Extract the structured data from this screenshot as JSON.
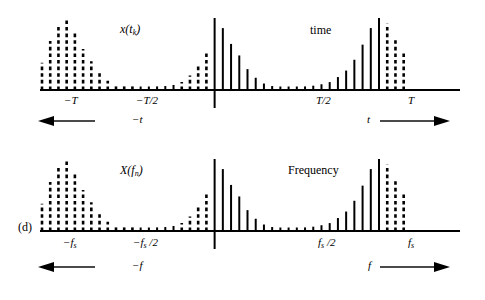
{
  "figure": {
    "panel_label": "(d)",
    "width": 485,
    "height": 300,
    "line_color": "#000000",
    "background": "#ffffff"
  },
  "top_plot": {
    "name": "time-domain-sampled-signal",
    "signal_label": "x(t",
    "signal_label_sub": "k",
    "signal_label_close": ")",
    "domain_label": "time",
    "tick_labels": [
      {
        "text": "−T",
        "x_px": 73
      },
      {
        "text": "−T/2",
        "x_px": 150
      },
      {
        "text": "T/2",
        "x_px": 325
      },
      {
        "text": "T",
        "x_px": 411
      }
    ],
    "left_arrow_label": "−t",
    "right_arrow_label": "t"
  },
  "bottom_plot": {
    "name": "frequency-domain-sampled-spectrum",
    "signal_label": "X(f",
    "signal_label_sub": "n",
    "signal_label_close": ")",
    "domain_label": "Frequency",
    "tick_labels": [
      {
        "text": "−f",
        "sub": "s",
        "tail": "",
        "x_px": 72
      },
      {
        "text": "−f",
        "sub": "s",
        "tail": " /2",
        "x_px": 147
      },
      {
        "text": "f",
        "sub": "s",
        "tail": " /2",
        "x_px": 325
      },
      {
        "text": "f",
        "sub": "s",
        "tail": "",
        "x_px": 412
      }
    ],
    "left_arrow_label": "−f",
    "right_arrow_label": "f"
  },
  "chart_data": [
    {
      "type": "bar",
      "title": "x(t_k)",
      "xlabel": "time",
      "ylabel": "",
      "axis_y_px": 90,
      "x_start_px": 42,
      "x_step_px": 8.22,
      "baseline_px": 90,
      "max_height_px": 72,
      "center_index": 21,
      "center_below_axis_px": 18,
      "tick_positions": {
        "minus_T": 4,
        "minus_T_half": 13,
        "T_half": 34,
        "T": 43
      },
      "xlim_px": [
        40,
        460
      ],
      "grid": false,
      "legend": null,
      "series": [
        {
          "name": "sampled-signal",
          "values": [
            0.38,
            0.68,
            0.88,
            1.0,
            0.82,
            0.57,
            0.4,
            0.26,
            0.13,
            0.09,
            0.06,
            0.05,
            0.04,
            0.045,
            0.05,
            0.055,
            0.07,
            0.11,
            0.2,
            0.33,
            0.52,
            1.0,
            0.86,
            0.64,
            0.48,
            0.29,
            0.17,
            0.09,
            0.055,
            0.045,
            0.04,
            0.045,
            0.05,
            0.06,
            0.08,
            0.11,
            0.18,
            0.27,
            0.42,
            0.63,
            0.86,
            1.0,
            0.92,
            0.73,
            0.52
          ],
          "styles": [
            "dash",
            "dash",
            "dash",
            "dash",
            "dash",
            "dash",
            "dash",
            "dash",
            "dash",
            "dash",
            "dash",
            "dash",
            "solid",
            "solid",
            "solid",
            "solid",
            "solid",
            "dash",
            "dash",
            "dash",
            "dash",
            "solid",
            "solid",
            "solid",
            "solid",
            "solid",
            "solid",
            "solid",
            "solid",
            "solid",
            "solid",
            "solid",
            "solid",
            "solid",
            "solid",
            "solid",
            "solid",
            "solid",
            "solid",
            "solid",
            "solid",
            "solid",
            "dash",
            "dash",
            "dash"
          ]
        }
      ]
    },
    {
      "type": "bar",
      "title": "X(f_n)",
      "xlabel": "Frequency",
      "ylabel": "",
      "axis_y_px": 231,
      "x_start_px": 42,
      "x_step_px": 8.22,
      "baseline_px": 231,
      "max_height_px": 72,
      "center_index": 21,
      "center_below_axis_px": 18,
      "tick_positions": {
        "minus_fs": 4,
        "minus_fs_half": 13,
        "fs_half": 34,
        "fs": 43
      },
      "xlim_px": [
        40,
        460
      ],
      "grid": false,
      "legend": null,
      "series": [
        {
          "name": "sampled-spectrum",
          "values": [
            0.38,
            0.68,
            0.88,
            1.0,
            0.82,
            0.57,
            0.4,
            0.26,
            0.13,
            0.09,
            0.06,
            0.05,
            0.04,
            0.045,
            0.05,
            0.055,
            0.07,
            0.11,
            0.2,
            0.33,
            0.52,
            1.0,
            0.86,
            0.64,
            0.48,
            0.29,
            0.17,
            0.09,
            0.055,
            0.045,
            0.04,
            0.045,
            0.05,
            0.06,
            0.08,
            0.11,
            0.18,
            0.27,
            0.42,
            0.63,
            0.86,
            1.0,
            0.92,
            0.73,
            0.52
          ],
          "styles": [
            "dash",
            "dash",
            "dash",
            "dash",
            "dash",
            "dash",
            "dash",
            "dash",
            "dash",
            "dash",
            "dash",
            "dash",
            "solid",
            "solid",
            "solid",
            "solid",
            "solid",
            "dash",
            "dash",
            "dash",
            "dash",
            "solid",
            "solid",
            "solid",
            "solid",
            "solid",
            "solid",
            "solid",
            "solid",
            "solid",
            "solid",
            "solid",
            "solid",
            "solid",
            "solid",
            "solid",
            "solid",
            "solid",
            "solid",
            "solid",
            "solid",
            "solid",
            "dash",
            "dash",
            "dash"
          ]
        }
      ]
    }
  ]
}
